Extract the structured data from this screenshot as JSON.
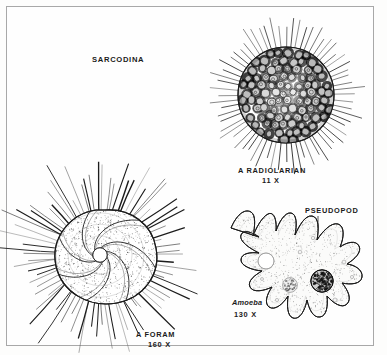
{
  "figure": {
    "title": "SARCODINA",
    "background_color": "#fdfdfc",
    "ink_color": "#1b1b1b",
    "border_color": "#a8a8a8",
    "style": "line-drawing"
  },
  "specimens": [
    {
      "id": "radiolarian",
      "label": "A RADIOLARIAN",
      "magnification": "11 X",
      "shape": "sphere",
      "features": [
        "porous lattice skeleton",
        "radiating spines",
        "vacuoles"
      ]
    },
    {
      "id": "foram",
      "label": "A FORAM",
      "magnification": "160 X",
      "shape": "spiral chambered shell",
      "features": [
        "spiral chambers",
        "stippled cytoplasm",
        "radiating pseudopodia",
        "central aperture"
      ]
    },
    {
      "id": "amoeba",
      "label": "Amoeba",
      "magnification": "130 X",
      "shape": "irregular lobed",
      "features": [
        "pseudopodia",
        "nucleus",
        "contractile vacuole",
        "food vacuole",
        "stippled cytoplasm"
      ],
      "annotations": [
        {
          "text": "PSEUDOPOD",
          "points_to": "pseudopod-tip"
        }
      ]
    }
  ],
  "annotations": {
    "pseudopod": "PSEUDOPOD"
  }
}
